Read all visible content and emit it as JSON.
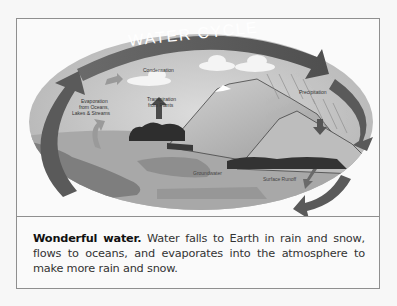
{
  "figure": {
    "title": "WATER CYCLE",
    "labels": {
      "condensation": "Condensation",
      "transpiration_line1": "Transpiration",
      "transpiration_line2": "from Plants",
      "evaporation_line1": "Evaporation",
      "evaporation_line2": "from Oceans,",
      "evaporation_line3": "Lakes & Streams",
      "precipitation": "Precipitation",
      "groundwater": "Groundwater",
      "surface_runoff": "Surface Runoff"
    },
    "caption": {
      "lead": "Wonderful water.",
      "body": " Water falls to Earth in rain and snow, flows to oceans, and evaporates into the atmosphere to make more rain and snow."
    }
  },
  "colors": {
    "page_background": "#f7f7f7",
    "frame_border": "#8f8f8f",
    "sky": "#c4c4c4",
    "arrow": "#5e5e5e",
    "mountain": "#b0b0b0",
    "water": "#8a8a8a",
    "trees": "#2e2e2e",
    "cloud": "#f4f4f4"
  }
}
